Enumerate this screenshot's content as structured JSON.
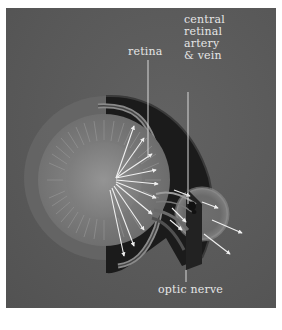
{
  "figure": {
    "labels": {
      "retina": "retina",
      "central_retinal_artery_vein": [
        "central",
        "retinal",
        "artery",
        "& vein"
      ],
      "optic_nerve": "optic nerve"
    },
    "colors": {
      "background_panel": "#5b5b5b",
      "label_text": "#e6e6e6",
      "leader_line": "#d8d8d8",
      "sclera_dark": "#1a1a1a",
      "vitreous": "#7a7a7a",
      "lens_center": "#8a8a8a",
      "arrow": "#f0f0f0"
    }
  }
}
